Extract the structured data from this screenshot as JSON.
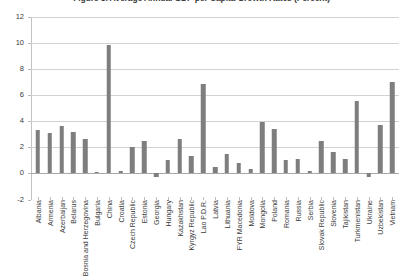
{
  "chart_data": {
    "type": "bar",
    "title": "Figure 8. Average Annual GDP per Capita Growth Rates (Percent)",
    "xlabel": "",
    "ylabel": "",
    "ylim": [
      -2,
      12
    ],
    "ytick_step": 2,
    "yticks": [
      "12",
      "10",
      "8",
      "6",
      "4",
      "2",
      "0",
      "-2"
    ],
    "grid": true,
    "legend": "none",
    "bar_color": "#7e7e7e",
    "axis_color": "#c2c2c2",
    "grid_color": "#d2d2d2",
    "categories": [
      "Albania",
      "Armenia",
      "Azerbaijan",
      "Belarus",
      "Bosnia and Herzegovina",
      "Bulgaria",
      "China",
      "Croatia",
      "Czech Republic",
      "Estonia",
      "Georgia",
      "Hungary",
      "Kazakhstan",
      "Kyrgyz Republic",
      "Lao P.D.R.",
      "Latvia",
      "Lithuania",
      "FYR Macedonia",
      "Moldova",
      "Mongolia",
      "Poland",
      "Romania",
      "Russia",
      "Serbia",
      "Slovak Republic",
      "Slovenia",
      "Tajikistan",
      "Turkmenistan",
      "Ukraine",
      "Uzbekistan",
      "Vietnam"
    ],
    "values": [
      3.3,
      3.1,
      3.6,
      3.2,
      2.6,
      0.1,
      9.8,
      0.15,
      2.0,
      2.5,
      -0.3,
      1.0,
      2.6,
      1.3,
      6.8,
      0.5,
      1.5,
      0.8,
      0.35,
      3.9,
      3.4,
      1.0,
      1.1,
      0.2,
      2.5,
      1.6,
      1.1,
      5.5,
      -0.3,
      3.7,
      7.0
    ]
  }
}
